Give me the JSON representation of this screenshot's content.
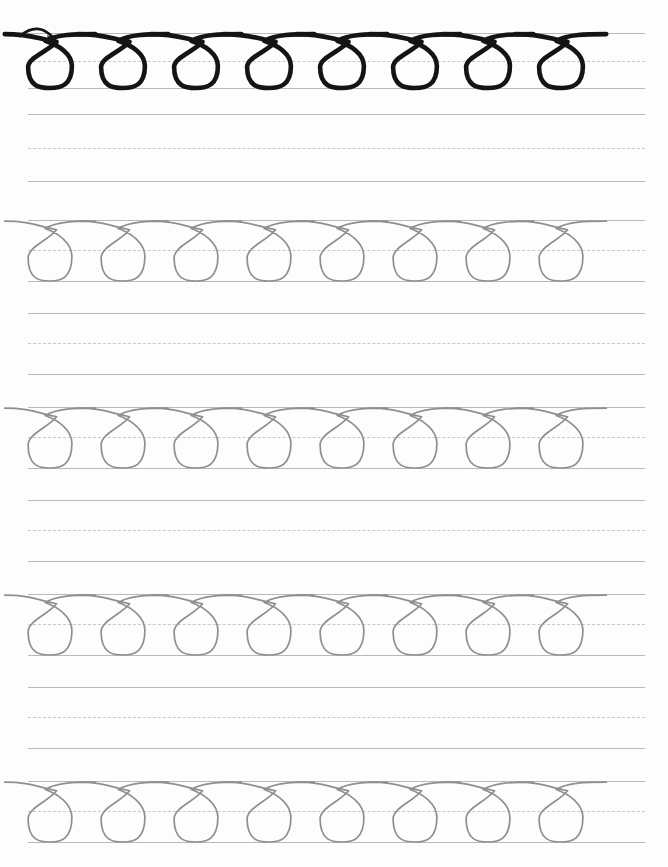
{
  "worksheet": {
    "title": "Cursive Loop Stroke Practice Worksheet",
    "description": "Ruled handwriting practice page with a traced loop model row and repeated light-gray loop rows for tracing.",
    "page": {
      "width": 668,
      "height": 867,
      "background_color": "#fdfdfd"
    },
    "rule_lines": {
      "left_x": 28,
      "right_x": 645,
      "solid_color": "#b9b9b9",
      "dashed_color": "#c8c8c8",
      "solid_width": 1.6,
      "dashed_width": 1.5,
      "dash_pattern": "8px dash, 5px gap",
      "row_pitch": 95,
      "band_height": 55
    },
    "stroke_style": {
      "model_color": "#141414",
      "model_stroke_width": 4.6,
      "trace_color": "#8f8f8f",
      "trace_stroke_width": 1.7
    },
    "loops": {
      "count_per_row": 8,
      "pitch": 73,
      "start_x": 50,
      "shape": "teardrop loop crossing near top line, bulb resting on baseline"
    },
    "arrow": {
      "present": true,
      "row_index": 1,
      "direction": "left-to-right curving down into first loop",
      "color": "#141414",
      "start_x": 20,
      "end_x": 60,
      "y": 38
    },
    "rows": [
      {
        "index": 1,
        "type": "model",
        "name": "model-loop-row",
        "top_line_y": 33,
        "mid_line_y": 61,
        "base_line_y": 88,
        "has_loops": true,
        "loop_style": "dark",
        "has_arrow": true
      },
      {
        "index": 2,
        "type": "practice",
        "name": "blank-practice-row",
        "top_line_y": 114,
        "mid_line_y": 148,
        "base_line_y": 181,
        "has_loops": false,
        "loop_style": "none",
        "has_arrow": false
      },
      {
        "index": 3,
        "type": "trace",
        "name": "trace-loop-row",
        "top_line_y": 220,
        "mid_line_y": 250,
        "base_line_y": 281,
        "has_loops": true,
        "loop_style": "gray",
        "has_arrow": false
      },
      {
        "index": 4,
        "type": "practice",
        "name": "blank-practice-row",
        "top_line_y": 313,
        "mid_line_y": 343,
        "base_line_y": 374,
        "has_loops": false,
        "loop_style": "none",
        "has_arrow": false
      },
      {
        "index": 5,
        "type": "trace",
        "name": "trace-loop-row",
        "top_line_y": 407,
        "mid_line_y": 437,
        "base_line_y": 468,
        "has_loops": true,
        "loop_style": "gray",
        "has_arrow": false
      },
      {
        "index": 6,
        "type": "practice",
        "name": "blank-practice-row",
        "top_line_y": 500,
        "mid_line_y": 530,
        "base_line_y": 561,
        "has_loops": false,
        "loop_style": "none",
        "has_arrow": false
      },
      {
        "index": 7,
        "type": "trace",
        "name": "trace-loop-row",
        "top_line_y": 594,
        "mid_line_y": 624,
        "base_line_y": 655,
        "has_loops": true,
        "loop_style": "gray",
        "has_arrow": false
      },
      {
        "index": 8,
        "type": "practice",
        "name": "blank-practice-row",
        "top_line_y": 687,
        "mid_line_y": 717,
        "base_line_y": 748,
        "has_loops": false,
        "loop_style": "none",
        "has_arrow": false
      },
      {
        "index": 9,
        "type": "trace",
        "name": "trace-loop-row",
        "top_line_y": 781,
        "mid_line_y": 811,
        "base_line_y": 842,
        "has_loops": true,
        "loop_style": "gray",
        "has_arrow": false
      }
    ]
  }
}
